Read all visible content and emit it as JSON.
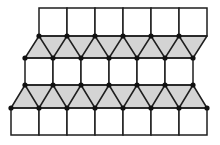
{
  "diagram": {
    "title": "Tiling of squares and triangles",
    "width": 220,
    "height": 145,
    "colors": {
      "stroke": "#1e1e1e",
      "triangle_fill": "#d4d4d4",
      "square_fill": "#ffffff",
      "vertex": "#111111"
    },
    "stroke_width": 1.5,
    "vertex_radius": 2.6,
    "unit": 28,
    "rows": {
      "y0": 8,
      "y1": 36,
      "y2": 58,
      "y3": 85,
      "y4": 108,
      "y5": 135
    },
    "top_squares": {
      "x_start": 39,
      "count": 6,
      "y_top": 8,
      "y_bottom": 36
    },
    "upper_triangle_band": {
      "top_y": 36,
      "bottom_y": 58,
      "top_x": [
        39,
        67,
        95,
        123,
        151,
        179,
        207
      ],
      "bottom_x": [
        25,
        53,
        81,
        109,
        137,
        165,
        193
      ],
      "top_vertices_x": [
        39,
        67,
        95,
        123,
        151,
        179
      ],
      "bottom_vertices_x": [
        25,
        53,
        81,
        109,
        137,
        165,
        193
      ]
    },
    "middle_squares": {
      "x_start": 25,
      "count": 6,
      "y_top": 58,
      "y_bottom": 85
    },
    "lower_triangle_band": {
      "top_y": 85,
      "bottom_y": 108,
      "top_x": [
        25,
        53,
        81,
        109,
        137,
        165,
        193
      ],
      "bottom_x": [
        11,
        39,
        67,
        95,
        123,
        151,
        179,
        207
      ],
      "top_vertices_x": [
        25,
        53,
        81,
        109,
        137,
        165,
        193
      ],
      "bottom_vertices_x": [
        11,
        39,
        67,
        95,
        123,
        151,
        179,
        207
      ]
    },
    "bottom_squares": {
      "x_start": 11,
      "count": 7,
      "y_top": 108,
      "y_bottom": 135
    }
  }
}
